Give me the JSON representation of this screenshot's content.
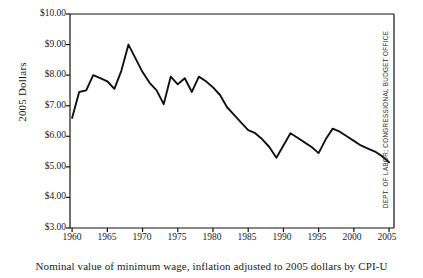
{
  "axes": {
    "ylabel": "2005 Dollars",
    "ytick_labels": [
      "$10.00",
      "$9.00",
      "$8.00",
      "$7.00",
      "$6.00",
      "$5.00",
      "$4.00",
      "$3.00"
    ],
    "xtick_labels": [
      "1960",
      "1965",
      "1970",
      "1975",
      "1980",
      "1985",
      "1990",
      "1995",
      "2000",
      "2005"
    ]
  },
  "caption": "Nominal value of minimum wage, inflation adjusted to 2005 dollars by CPI-U",
  "source": "DEPT. OF LABOR; CONGRESSIONAL BUDGET OFFICE",
  "style": {
    "line_color": "#111111",
    "axis_color": "#111111",
    "background": "#ffffff",
    "line_width": 1.9
  },
  "chart_data": {
    "type": "line",
    "title": "",
    "subtitle": "",
    "xlabel": "",
    "ylabel": "2005 Dollars",
    "xlim": [
      1959.7,
      2005.7
    ],
    "ylim": [
      3.0,
      10.0
    ],
    "grid": false,
    "legend": null,
    "xticks": [
      1960,
      1965,
      1970,
      1975,
      1980,
      1985,
      1990,
      1995,
      2000,
      2005
    ],
    "yticks": [
      3,
      4,
      5,
      6,
      7,
      8,
      9,
      10
    ],
    "ytick_format": "$0.00",
    "annotations": [],
    "series": [
      {
        "name": "Minimum wage in 2005 dollars",
        "x": [
          1960,
          1961,
          1962,
          1963,
          1964,
          1965,
          1966,
          1967,
          1968,
          1969,
          1970,
          1971,
          1972,
          1973,
          1974,
          1975,
          1976,
          1977,
          1978,
          1979,
          1980,
          1981,
          1982,
          1983,
          1984,
          1985,
          1986,
          1987,
          1988,
          1989,
          1990,
          1991,
          1992,
          1993,
          1994,
          1995,
          1996,
          1997,
          1998,
          1999,
          2000,
          2001,
          2002,
          2003,
          2004,
          2005
        ],
        "values": [
          6.6,
          7.45,
          7.5,
          8.0,
          7.9,
          7.8,
          7.55,
          8.15,
          9.0,
          8.55,
          8.1,
          7.75,
          7.5,
          7.05,
          7.95,
          7.7,
          7.9,
          7.45,
          7.95,
          7.8,
          7.6,
          7.35,
          6.95,
          6.7,
          6.45,
          6.2,
          6.1,
          5.9,
          5.65,
          5.3,
          5.7,
          6.1,
          5.95,
          5.8,
          5.65,
          5.45,
          5.9,
          6.25,
          6.15,
          6.0,
          5.85,
          5.7,
          5.6,
          5.5,
          5.35,
          5.15
        ]
      }
    ]
  }
}
